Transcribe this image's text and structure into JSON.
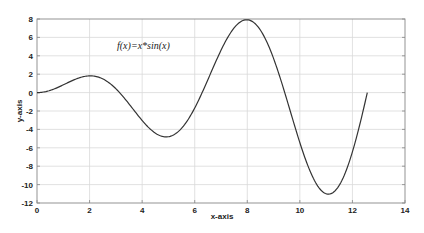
{
  "chart_data": {
    "type": "line",
    "title": "",
    "annotation": "f(x)=x*sin(x)",
    "xlabel": "x-axis",
    "ylabel": "y-axis",
    "xlim": [
      0,
      14
    ],
    "ylim": [
      -12,
      8
    ],
    "xticks": [
      0,
      2,
      4,
      6,
      8,
      10,
      12,
      14
    ],
    "yticks": [
      8,
      6,
      4,
      2,
      0,
      -2,
      -4,
      -6,
      -8,
      -10,
      -12
    ],
    "grid": true,
    "legend": null,
    "series": [
      {
        "name": "f(x)=x*sin(x)",
        "function": "x*sin(x)",
        "x_range": [
          0,
          12.566
        ],
        "color": "#333333",
        "key_points": [
          {
            "x": 0,
            "y": 0
          },
          {
            "x": 2.03,
            "y": 1.82
          },
          {
            "x": 3.14,
            "y": 0
          },
          {
            "x": 4.91,
            "y": -4.81
          },
          {
            "x": 6.28,
            "y": 0
          },
          {
            "x": 7.98,
            "y": 7.92
          },
          {
            "x": 9.42,
            "y": 0
          },
          {
            "x": 11.09,
            "y": -11.04
          },
          {
            "x": 12.57,
            "y": 0
          }
        ]
      }
    ]
  },
  "plot": {
    "left": 37,
    "top": 19,
    "right": 405,
    "bottom": 203,
    "grid_color": "#d9d9d9",
    "axis_color": "#888888"
  }
}
